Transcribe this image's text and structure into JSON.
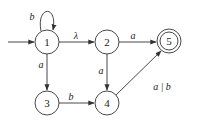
{
  "diagram": {
    "type": "finite-automaton",
    "start_state": "1",
    "accepting_states": [
      "5"
    ],
    "states": [
      {
        "id": "1",
        "label": "1",
        "x": 47,
        "y": 42
      },
      {
        "id": "2",
        "label": "2",
        "x": 107,
        "y": 42
      },
      {
        "id": "3",
        "label": "3",
        "x": 47,
        "y": 103
      },
      {
        "id": "4",
        "label": "4",
        "x": 107,
        "y": 103
      },
      {
        "id": "5",
        "label": "5",
        "x": 169,
        "y": 41
      }
    ],
    "transitions": [
      {
        "from": "1",
        "to": "1",
        "label": "b"
      },
      {
        "from": "1",
        "to": "2",
        "label": "λ"
      },
      {
        "from": "1",
        "to": "3",
        "label": "a"
      },
      {
        "from": "2",
        "to": "5",
        "label": "a"
      },
      {
        "from": "2",
        "to": "4",
        "label": "a"
      },
      {
        "from": "3",
        "to": "4",
        "label": "b"
      },
      {
        "from": "4",
        "to": "5",
        "label": "a | b"
      }
    ],
    "colors": {
      "stroke": "#333333",
      "background": "#ffffff"
    }
  }
}
